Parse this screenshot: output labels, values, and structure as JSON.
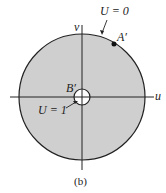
{
  "diagram": {
    "axis_u_label": "u",
    "axis_v_label": "v",
    "outer_boundary_label": "U = 0",
    "inner_boundary_label": "U = 1",
    "point_a_label": "A′",
    "point_b_label": "B′",
    "caption": "(b)",
    "colors": {
      "fill": "#cfcfcf",
      "stroke": "#222222"
    }
  }
}
